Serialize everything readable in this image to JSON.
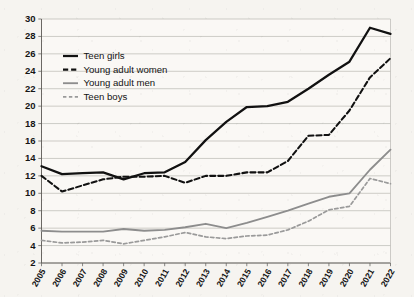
{
  "chart_data": {
    "type": "line",
    "title": "",
    "xlabel": "",
    "ylabel": "",
    "ylim": [
      2,
      30
    ],
    "ytick_step": 2,
    "grid": true,
    "legend_position": "upper-left-inside",
    "categories": [
      "2005",
      "2006",
      "2007",
      "2008",
      "2009",
      "2010",
      "2011",
      "2012",
      "2013",
      "2014",
      "2015",
      "2016",
      "2017",
      "2018",
      "2019",
      "2020",
      "2021",
      "2022"
    ],
    "yticks": [
      "2",
      "4",
      "6",
      "8",
      "10",
      "12",
      "14",
      "16",
      "18",
      "20",
      "22",
      "24",
      "26",
      "28",
      "30"
    ],
    "series": [
      {
        "name": "Teen girls",
        "style": "solid-thick",
        "color": "#111111",
        "values": [
          13.1,
          12.2,
          12.3,
          12.4,
          11.6,
          12.3,
          12.4,
          13.6,
          16.1,
          18.2,
          19.9,
          20.0,
          20.5,
          22.0,
          23.6,
          25.1,
          29.0,
          28.3
        ]
      },
      {
        "name": "Young adult women",
        "style": "dashed-thick",
        "color": "#111111",
        "values": [
          12.0,
          10.2,
          10.9,
          11.6,
          11.9,
          11.9,
          12.0,
          11.2,
          12.0,
          12.0,
          12.4,
          12.4,
          13.7,
          16.6,
          16.7,
          19.5,
          23.3,
          25.5
        ]
      },
      {
        "name": "Young adult men",
        "style": "solid-thin",
        "color": "#8d8d8d",
        "values": [
          5.7,
          5.6,
          5.6,
          5.6,
          5.9,
          5.7,
          5.8,
          6.1,
          6.5,
          6.0,
          6.6,
          7.3,
          8.0,
          8.8,
          9.6,
          10.0,
          12.7,
          15.0
        ]
      },
      {
        "name": "Teen boys",
        "style": "dashed-thin",
        "color": "#9a9a9a",
        "values": [
          4.6,
          4.3,
          4.4,
          4.6,
          4.2,
          4.6,
          5.0,
          5.5,
          5.0,
          4.8,
          5.1,
          5.2,
          5.8,
          6.8,
          8.1,
          8.5,
          11.7,
          11.1
        ]
      }
    ]
  },
  "legend": {
    "items": [
      {
        "label": "Teen girls"
      },
      {
        "label": "Young adult women"
      },
      {
        "label": "Young adult men"
      },
      {
        "label": "Teen boys"
      }
    ]
  }
}
